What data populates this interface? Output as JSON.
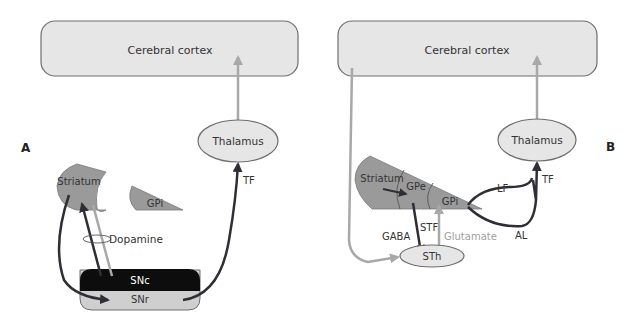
{
  "panels": [
    {
      "letter": "A",
      "cortex": "Cerebral cortex",
      "thalamus": "Thalamus",
      "striatum": "Striatum",
      "gpi": "GPi",
      "dopamine": "Dopamine",
      "snc": "SNc",
      "snr": "SNr",
      "tf": "TF"
    },
    {
      "letter": "B",
      "cortex": "Cerebral cortex",
      "thalamus": "Thalamus",
      "striatum": "Striatum",
      "gpe": "GPe",
      "gpi": "GPi",
      "lf": "LF",
      "al": "AL",
      "tf": "TF",
      "stf": "STF",
      "gaba": "GABA",
      "glutamate": "Glutamate",
      "sth": "STh"
    }
  ],
  "colors": {
    "background": "#ffffff",
    "box_fill": "#e6e6e6",
    "box_stroke": "#6e6e6e",
    "nucleus_fill": "#9a9a9a",
    "snc_fill": "#0d0d0d",
    "snr_fill": "#cfcfcf",
    "dark_arrow": "#2e2e34",
    "light_arrow": "#a8a8a8",
    "glutamate_text": "#a0a0a0"
  }
}
